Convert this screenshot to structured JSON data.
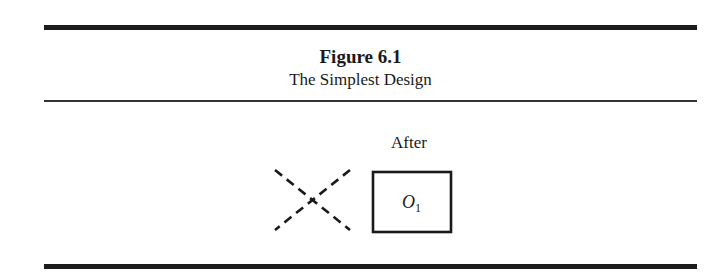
{
  "figure": {
    "number_label": "Figure 6.1",
    "title": "The Simplest Design"
  },
  "diagram": {
    "column_header": "After",
    "pretest_marker": "no-pretest-cross",
    "observation": {
      "symbol": "O",
      "subscript": "1"
    }
  }
}
